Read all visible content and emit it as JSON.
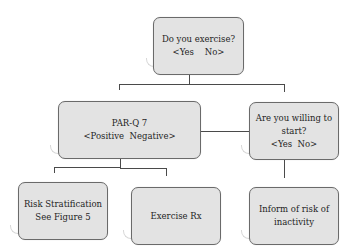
{
  "diagram": {
    "type": "flowchart",
    "nodes": {
      "exercise_question": {
        "line1": "Do you exercise?",
        "line2": "<Yes    No>"
      },
      "parq": {
        "line1": "PAR-Q 7",
        "line2": "<Positive  Negative>"
      },
      "willing": {
        "line1": "Are you willing to",
        "line2": "start?",
        "line3": "<Yes  No>"
      },
      "risk": {
        "line1": "Risk Stratification",
        "line2": "See Figure 5"
      },
      "exercise_rx": {
        "line1": "Exercise Rx"
      },
      "inform": {
        "line1": "Inform of risk of",
        "line2": "inactivity"
      }
    },
    "edges": [
      {
        "from": "exercise_question",
        "to": "parq",
        "label": "Yes"
      },
      {
        "from": "exercise_question",
        "to": "willing",
        "label": "No"
      },
      {
        "from": "willing",
        "to": "parq",
        "label": "Yes"
      },
      {
        "from": "parq",
        "to": "risk",
        "label": "Positive"
      },
      {
        "from": "parq",
        "to": "exercise_rx",
        "label": "Negative"
      },
      {
        "from": "willing",
        "to": "inform",
        "label": "No"
      }
    ],
    "colors": {
      "box_fill": "#e3e3e3",
      "box_border": "#6a6a6a",
      "line": "#4a4a4a",
      "text": "#1e1e1e"
    }
  }
}
